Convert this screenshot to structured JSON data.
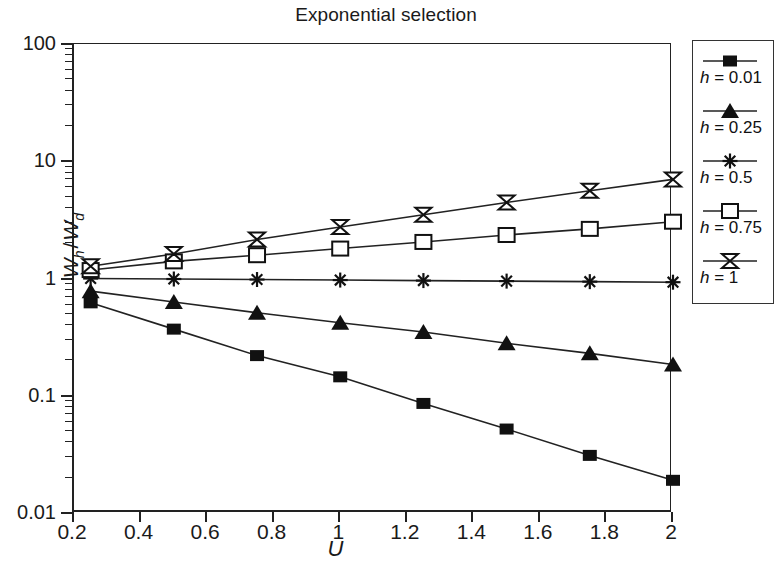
{
  "title": "Exponential selection",
  "axes": {
    "x_label": "U",
    "y_label_num": "W",
    "y_label_num_sub": "h",
    "y_label_sep": "/",
    "y_label_den": "W",
    "y_label_den_sub": "d",
    "x_ticks": [
      "0.2",
      "0.4",
      "0.6",
      "0.8",
      "1",
      "1.2",
      "1.4",
      "1.6",
      "1.8",
      "2"
    ],
    "y_ticks": [
      "100",
      "10",
      "1",
      "0.1",
      "0.01"
    ]
  },
  "legend": {
    "entries": [
      {
        "label_var": "h",
        "label_eq": " = ",
        "label_value": "0.01",
        "marker": "filled-square-marker"
      },
      {
        "label_var": "h",
        "label_eq": " = ",
        "label_value": "0.25",
        "marker": "filled-triangle-marker"
      },
      {
        "label_var": "h",
        "label_eq": " = ",
        "label_value": "0.5",
        "marker": "asterisk-marker"
      },
      {
        "label_var": "h",
        "label_eq": " = ",
        "label_value": "0.75",
        "marker": "open-square-marker"
      },
      {
        "label_var": "h",
        "label_eq": " = ",
        "label_value": "1",
        "marker": "bowtie-marker"
      }
    ]
  },
  "chart_data": {
    "type": "line",
    "title": "Exponential selection",
    "xlabel": "U",
    "ylabel": "Wh / Wd",
    "xlim": [
      0.2,
      2
    ],
    "ylim": [
      0.01,
      100
    ],
    "yscale": "log",
    "xscale": "linear",
    "grid": false,
    "legend_position": "right-outside",
    "x": [
      0.25,
      0.5,
      0.75,
      1.0,
      1.25,
      1.5,
      1.75,
      2.0
    ],
    "series": [
      {
        "name": "h = 0.01",
        "marker": "filled-square",
        "values": [
          0.62,
          0.37,
          0.22,
          0.145,
          0.086,
          0.052,
          0.031,
          0.019
        ]
      },
      {
        "name": "h = 0.25",
        "marker": "filled-triangle",
        "values": [
          0.78,
          0.63,
          0.51,
          0.42,
          0.35,
          0.28,
          0.23,
          0.185
        ]
      },
      {
        "name": "h = 0.5",
        "marker": "asterisk",
        "values": [
          1.0,
          0.99,
          0.98,
          0.97,
          0.96,
          0.95,
          0.94,
          0.93
        ]
      },
      {
        "name": "h = 0.75",
        "marker": "open-square",
        "values": [
          1.18,
          1.4,
          1.58,
          1.8,
          2.05,
          2.35,
          2.65,
          3.05
        ]
      },
      {
        "name": "h = 1",
        "marker": "bowtie",
        "values": [
          1.27,
          1.62,
          2.15,
          2.75,
          3.5,
          4.45,
          5.6,
          7.0
        ]
      }
    ]
  },
  "colors": {
    "line": "#222222",
    "axis": "#222222",
    "background": "#ffffff"
  }
}
